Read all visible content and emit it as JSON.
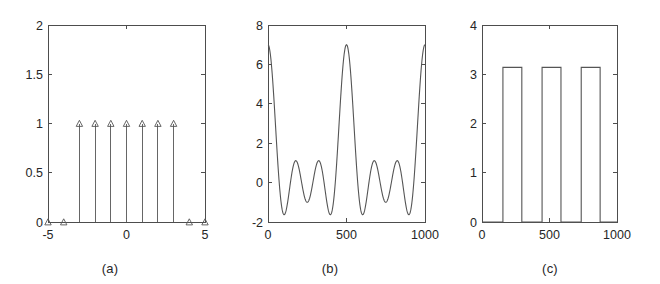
{
  "figure": {
    "background_color": "#ffffff",
    "line_color": "#555555",
    "axis_color": "#4d4d4d",
    "text_color": "#262626",
    "panel_count": 3
  },
  "panels": [
    {
      "caption": "(a)",
      "chart_data": {
        "type": "scatter",
        "plot_style": "stem",
        "title": "",
        "xlabel": "",
        "ylabel": "",
        "xlim": [
          -5,
          5
        ],
        "ylim": [
          0,
          2
        ],
        "xticks": [
          -5,
          0,
          5
        ],
        "xticklabels": [
          "-5",
          "0",
          "5"
        ],
        "yticks": [
          0,
          0.5,
          1,
          1.5,
          2
        ],
        "yticklabels": [
          "0",
          "0.5",
          "1",
          "1.5",
          "2"
        ],
        "grid": false,
        "legend": null,
        "marker": "triangle-up-open",
        "x": [
          -5,
          -4,
          -3,
          -2,
          -1,
          0,
          1,
          2,
          3,
          4,
          5
        ],
        "values": [
          0,
          0,
          1,
          1,
          1,
          1,
          1,
          1,
          1,
          0,
          0
        ],
        "description": "Discrete rectangular window: unit samples for |n| <= 3, zero elsewhere"
      }
    },
    {
      "caption": "(b)",
      "chart_data": {
        "type": "line",
        "plot_style": "continuous",
        "title": "",
        "xlabel": "",
        "ylabel": "",
        "xlim": [
          0,
          1000
        ],
        "ylim": [
          -2,
          8
        ],
        "xticks": [
          0,
          500,
          1000
        ],
        "xticklabels": [
          "0",
          "500",
          "1000"
        ],
        "yticks": [
          -2,
          0,
          2,
          4,
          6,
          8
        ],
        "yticklabels": [
          "-2",
          "0",
          "2",
          "4",
          "6",
          "8"
        ],
        "grid": false,
        "legend": null,
        "series": [
          {
            "name": "dirichlet-kernel",
            "formula": "1 + 2*sum_{k=1..3} cos(2*pi*k*x/500)",
            "n_terms": 7,
            "x_sample": [
              0,
              60,
              120,
              180,
              220,
              250,
              310,
              375,
              440,
              500,
              560,
              625,
              690,
              750,
              780,
              820,
              880,
              940,
              1000
            ],
            "y_sample": [
              7,
              5.0,
              1.6,
              -1.1,
              -1.65,
              -1.4,
              0.4,
              1.1,
              0.1,
              -1.0,
              0.1,
              1.1,
              0.4,
              -1.4,
              -1.65,
              -1.1,
              1.6,
              5.0,
              7
            ]
          }
        ],
        "description": "Dirichlet kernel, DTFT of the 7-point rectangular window; main lobe peaks at 7"
      }
    },
    {
      "caption": "(c)",
      "chart_data": {
        "type": "line",
        "plot_style": "square-wave",
        "title": "",
        "xlabel": "",
        "ylabel": "",
        "xlim": [
          0,
          1000
        ],
        "ylim": [
          0,
          4
        ],
        "xticks": [
          0,
          500,
          1000
        ],
        "xticklabels": [
          "0",
          "500",
          "1000"
        ],
        "yticks": [
          0,
          1,
          2,
          3,
          4
        ],
        "yticklabels": [
          "0",
          "1",
          "2",
          "3",
          "4"
        ],
        "grid": false,
        "legend": null,
        "high_level": 3.14,
        "low_level": 0,
        "transitions": [
          155,
          295,
          445,
          585,
          735,
          875
        ],
        "x_sample": [
          0,
          155,
          155,
          295,
          295,
          445,
          445,
          585,
          585,
          735,
          735,
          875,
          875,
          1000
        ],
        "y_sample": [
          0,
          0,
          3.14,
          3.14,
          0,
          0,
          3.14,
          3.14,
          0,
          0,
          3.14,
          3.14,
          0,
          0
        ],
        "description": "Phase response: square wave alternating between 0 and pi"
      }
    }
  ]
}
